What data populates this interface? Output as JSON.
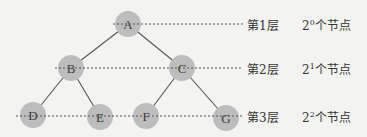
{
  "diagram": {
    "type": "complete-binary-tree",
    "node_fill": "#bdbdbd",
    "edge_color": "#555555",
    "guide_color": "#555555",
    "background": "#f3f3f1",
    "nodes": [
      {
        "id": "A",
        "label": "A",
        "level": 1
      },
      {
        "id": "B",
        "label": "B",
        "level": 2
      },
      {
        "id": "C",
        "label": "C",
        "level": 2
      },
      {
        "id": "D",
        "label": "D",
        "level": 3
      },
      {
        "id": "E",
        "label": "E",
        "level": 3
      },
      {
        "id": "F",
        "label": "F",
        "level": 3
      },
      {
        "id": "G",
        "label": "G",
        "level": 3
      }
    ],
    "edges": [
      [
        "A",
        "B"
      ],
      [
        "A",
        "C"
      ],
      [
        "B",
        "D"
      ],
      [
        "B",
        "E"
      ],
      [
        "C",
        "F"
      ],
      [
        "C",
        "G"
      ]
    ],
    "levels": [
      {
        "name": "第1层",
        "base": "2",
        "exponent": "0",
        "suffix": "个节点"
      },
      {
        "name": "第2层",
        "base": "2",
        "exponent": "1",
        "suffix": "个节点"
      },
      {
        "name": "第3层",
        "base": "2",
        "exponent": "2",
        "suffix": "个节点"
      }
    ]
  }
}
